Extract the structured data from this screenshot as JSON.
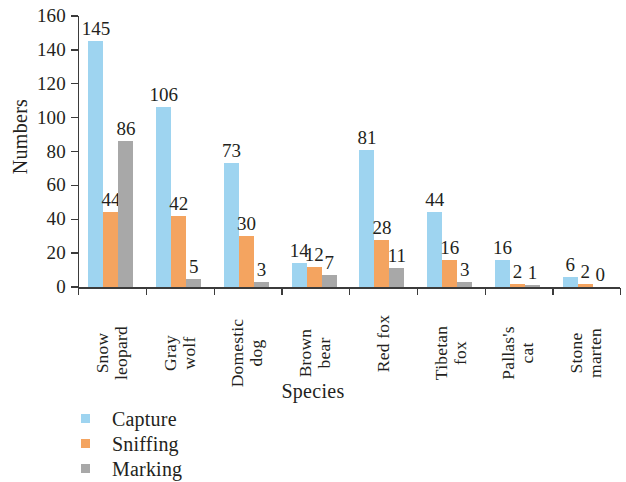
{
  "chart_data": {
    "type": "bar",
    "title": "",
    "xlabel": "Species",
    "ylabel": "Numbers",
    "ylim": [
      0,
      160
    ],
    "ytick_step": 20,
    "yticks": [
      0,
      20,
      40,
      60,
      80,
      100,
      120,
      140,
      160
    ],
    "grid": false,
    "legend_position": "bottom-left",
    "categories": [
      "Snow\nleopard",
      "Gray\nwolf",
      "Domestic\ndog",
      "Brown\nbear",
      "Red fox",
      "Tibetan\nfox",
      "Pallas's\ncat",
      "Stone\nmarten"
    ],
    "series": [
      {
        "name": "Capture",
        "color": "#9ED4F0",
        "values": [
          145,
          106,
          73,
          14,
          81,
          44,
          16,
          6
        ]
      },
      {
        "name": "Sniffing",
        "color": "#F4A460",
        "values": [
          44,
          42,
          30,
          12,
          28,
          16,
          2,
          2
        ]
      },
      {
        "name": "Marking",
        "color": "#A8A8A8",
        "values": [
          86,
          5,
          3,
          7,
          11,
          3,
          1,
          0
        ]
      }
    ]
  },
  "axes": {
    "y_title": "Numbers",
    "x_title": "Species"
  },
  "legend": {
    "items": [
      {
        "label": "Capture",
        "swatch": "#9ED4F0"
      },
      {
        "label": "Sniffing",
        "swatch": "#F4A460"
      },
      {
        "label": "Marking",
        "swatch": "#A8A8A8"
      }
    ]
  }
}
